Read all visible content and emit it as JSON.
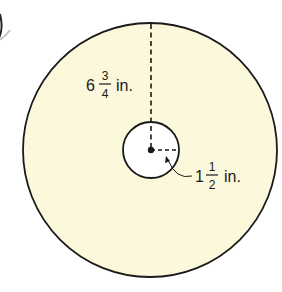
{
  "diagram": {
    "type": "concentric circles (annulus)",
    "colors": {
      "fill": "#fbf8dc",
      "stroke": "#1a1a1a",
      "inner_fill": "#ffffff"
    },
    "outer_radius_label": {
      "whole": "6",
      "numerator": "3",
      "denominator": "4",
      "unit": "in."
    },
    "inner_radius_label": {
      "whole": "1",
      "numerator": "1",
      "denominator": "2",
      "unit": "in."
    }
  }
}
